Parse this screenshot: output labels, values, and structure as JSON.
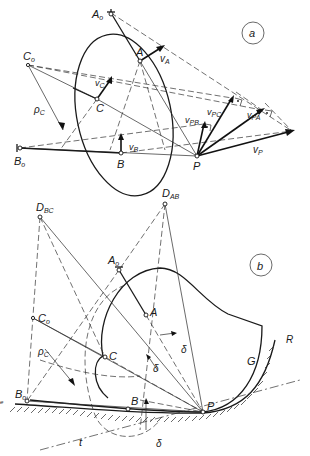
{
  "figure": {
    "panel_a": {
      "label": "a",
      "points": {
        "A0": {
          "name": "A",
          "sub": "o",
          "x": 111,
          "y": 13
        },
        "A": {
          "name": "A",
          "x": 140,
          "y": 61
        },
        "C0": {
          "name": "C",
          "sub": "o",
          "x": 28,
          "y": 65
        },
        "C": {
          "name": "C",
          "x": 97,
          "y": 99
        },
        "B0": {
          "name": "B",
          "sub": "o",
          "x": 20,
          "y": 148
        },
        "B": {
          "name": "B",
          "x": 121,
          "y": 153
        },
        "P": {
          "name": "P",
          "x": 197,
          "y": 156
        }
      },
      "vectors": {
        "vA": {
          "label": "v",
          "sub": "A"
        },
        "vC": {
          "label": "v",
          "sub": "C"
        },
        "vB": {
          "label": "v",
          "sub": "B"
        },
        "vP": {
          "label": "v",
          "sub": "P"
        },
        "vPA": {
          "label": "v",
          "sub": "PA"
        },
        "vPB": {
          "label": "v",
          "sub": "PB"
        },
        "vPC": {
          "label": "v",
          "sub": "PC"
        }
      },
      "radius_label": {
        "label": "ρ",
        "sub": "C"
      }
    },
    "panel_b": {
      "label": "b",
      "points": {
        "DBC": {
          "name": "D",
          "sub": "BC",
          "x": 40,
          "y": 217
        },
        "DAB": {
          "name": "D",
          "sub": "AB",
          "x": 165,
          "y": 204
        },
        "A0": {
          "name": "A",
          "sub": "o",
          "x": 119,
          "y": 270
        },
        "A": {
          "name": "A",
          "x": 146,
          "y": 315
        },
        "C0": {
          "name": "C",
          "sub": "o",
          "x": 33,
          "y": 318
        },
        "C": {
          "name": "C",
          "x": 105,
          "y": 357
        },
        "B0": {
          "name": "B",
          "sub": "o",
          "x": 27,
          "y": 401
        },
        "B": {
          "name": "B",
          "x": 128,
          "y": 409
        },
        "P": {
          "name": "P",
          "x": 203,
          "y": 412
        }
      },
      "labels": {
        "rho": {
          "label": "ρ",
          "sub": "C"
        },
        "delta": "δ",
        "tangent": "t",
        "body": "G",
        "frame": "R",
        "edge_mark": "e"
      }
    }
  }
}
